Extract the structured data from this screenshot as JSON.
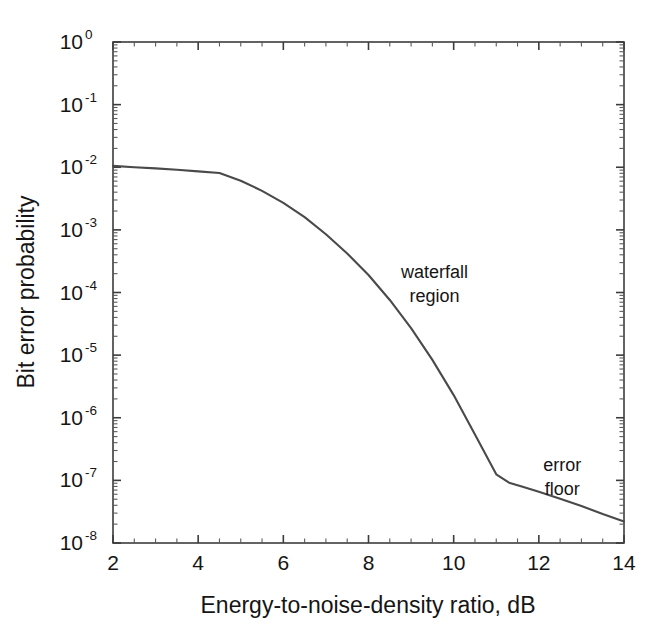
{
  "chart_data": {
    "type": "line",
    "title": "",
    "xlabel": "Energy-to-noise-density ratio, dB",
    "ylabel": "Bit error probability",
    "xscale": "linear",
    "yscale": "log",
    "xlim": [
      2,
      14
    ],
    "ylim": [
      1e-08,
      1
    ],
    "grid": false,
    "legend": "none",
    "xticks": [
      2,
      4,
      6,
      8,
      10,
      12,
      14
    ],
    "xtick_labels": [
      "2",
      "4",
      "6",
      "8",
      "10",
      "12",
      "14"
    ],
    "yticks": [
      1,
      0.1,
      0.01,
      0.001,
      0.0001,
      1e-05,
      1e-06,
      1e-07,
      1e-08
    ],
    "ytick_labels": [
      "10^0",
      "10^-1",
      "10^-2",
      "10^-3",
      "10^-4",
      "10^-5",
      "10^-6",
      "10^-7",
      "10^-8"
    ],
    "ytick_mantissas": [
      "10",
      "10",
      "10",
      "10",
      "10",
      "10",
      "10",
      "10",
      "10"
    ],
    "ytick_exponents": [
      "0",
      "-1",
      "-2",
      "-3",
      "-4",
      "-5",
      "-6",
      "-7",
      "-8"
    ],
    "series": [
      {
        "name": "bit error probability",
        "color": "#4a4a4a",
        "x": [
          2.0,
          2.5,
          3.0,
          3.5,
          4.0,
          4.5,
          5.0,
          5.5,
          6.0,
          6.5,
          7.0,
          7.5,
          8.0,
          8.5,
          9.0,
          9.5,
          10.0,
          10.5,
          11.0,
          11.3,
          11.6,
          12.0,
          12.5,
          13.0,
          13.5,
          14.0
        ],
        "y": [
          0.0105,
          0.01,
          0.0096,
          0.0091,
          0.0086,
          0.0081,
          0.0061,
          0.0042,
          0.0027,
          0.0016,
          0.00085,
          0.00042,
          0.00019,
          7.6e-05,
          2.7e-05,
          8.4e-06,
          2.3e-06,
          5.4e-07,
          1.25e-07,
          9.2e-08,
          8e-08,
          6.6e-08,
          5.1e-08,
          3.9e-08,
          2.9e-08,
          2.2e-08
        ]
      }
    ],
    "annotations": [
      {
        "id": "waterfall",
        "lines": [
          "waterfall",
          "region"
        ],
        "x": 9.55,
        "y": 0.00017
      },
      {
        "id": "error-floor",
        "lines": [
          "error",
          "floor"
        ],
        "x": 12.55,
        "y": 1.4e-07
      }
    ]
  }
}
